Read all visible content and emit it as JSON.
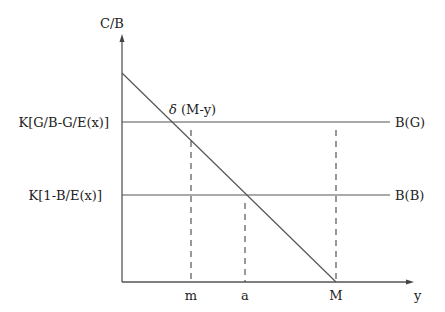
{
  "diagram": {
    "y_axis_label": "C/B",
    "x_axis_label": "y",
    "horizontal_lines": [
      {
        "left_label": "K[G/B-G/E(x)]",
        "right_label": "B(G)"
      },
      {
        "left_label": "K[1-B/E(x)]",
        "right_label": "B(B)"
      }
    ],
    "diagonal_label_symbol": "δ",
    "diagonal_label_expr": "(M-y)",
    "x_ticks": [
      "m",
      "a",
      "M"
    ],
    "colors": {
      "line": "#555555",
      "text": "#222222",
      "background": "#ffffff"
    }
  }
}
